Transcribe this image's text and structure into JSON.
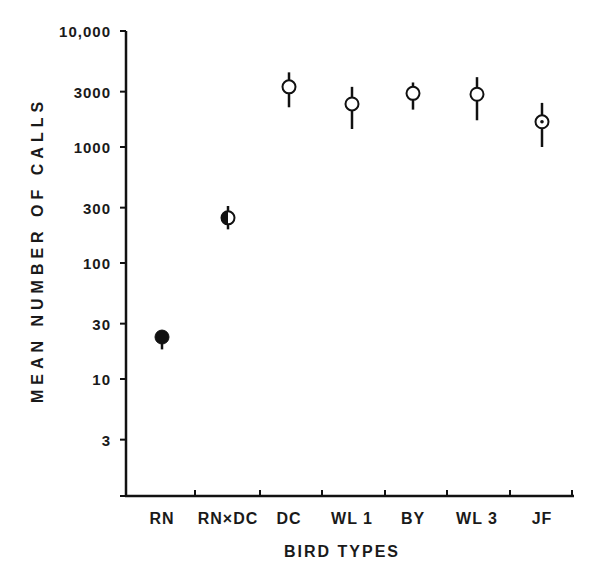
{
  "chart_data": {
    "type": "scatter",
    "title": "",
    "xlabel": "BIRD TYPES",
    "ylabel": "MEAN NUMBER OF CALLS",
    "yscale": "log",
    "ylim": [
      1,
      10000
    ],
    "yticks": [
      {
        "value": 10000,
        "label": "10,000"
      },
      {
        "value": 3000,
        "label": "3000"
      },
      {
        "value": 1000,
        "label": "1000"
      },
      {
        "value": 300,
        "label": "300"
      },
      {
        "value": 100,
        "label": "100"
      },
      {
        "value": 30,
        "label": "30"
      },
      {
        "value": 10,
        "label": "10"
      },
      {
        "value": 3,
        "label": "3"
      }
    ],
    "categories": [
      "RN",
      "RNxDC",
      "DC",
      "WL 1",
      "BY",
      "WL 3",
      "JF"
    ],
    "category_labels": [
      "RN",
      "RN×DC",
      "DC",
      "WL 1",
      "BY",
      "WL 3",
      "JF"
    ],
    "grid": false,
    "legend": null,
    "series": [
      {
        "name": "Mean number of calls",
        "values": [
          23,
          245,
          3300,
          2350,
          2900,
          2850,
          1650
        ],
        "error_low": [
          18,
          195,
          2200,
          1430,
          2100,
          1700,
          1000
        ],
        "error_high": [
          23,
          310,
          4400,
          3300,
          3600,
          4000,
          2400
        ],
        "marker_styles": [
          "filled",
          "half-filled",
          "open",
          "open",
          "open",
          "open",
          "open-dot"
        ]
      }
    ]
  },
  "axes": {
    "y_title": "MEAN NUMBER OF CALLS",
    "x_title": "BIRD TYPES"
  }
}
